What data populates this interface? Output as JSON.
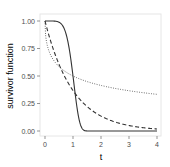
{
  "chart_data": {
    "type": "line",
    "title": "",
    "xlabel": "t",
    "ylabel": "survivor function",
    "xlim": [
      0,
      4
    ],
    "ylim": [
      0,
      1
    ],
    "x_ticks": [
      "0",
      "1",
      "2",
      "3",
      "4"
    ],
    "y_ticks": [
      "0.00",
      "0.25",
      "0.50",
      "0.75",
      "1.00"
    ],
    "grid": false,
    "legend": null,
    "x": [
      0,
      0.25,
      0.5,
      0.75,
      1,
      1.25,
      1.5,
      1.75,
      2,
      2.5,
      3,
      3.5,
      4
    ],
    "series": [
      {
        "name": "solid",
        "style": "solid",
        "values": [
          1.0,
          1.0,
          0.99,
          0.91,
          0.5,
          0.12,
          0.01,
          0.0,
          0.0,
          0.0,
          0.0,
          0.0,
          0.0
        ]
      },
      {
        "name": "dashed",
        "style": "dashed",
        "values": [
          1.0,
          0.78,
          0.61,
          0.47,
          0.37,
          0.29,
          0.22,
          0.17,
          0.14,
          0.08,
          0.05,
          0.03,
          0.02
        ]
      },
      {
        "name": "dotted",
        "style": "dotted",
        "values": [
          1.0,
          0.67,
          0.59,
          0.54,
          0.5,
          0.47,
          0.45,
          0.43,
          0.41,
          0.39,
          0.37,
          0.35,
          0.33
        ]
      }
    ]
  },
  "colors": {
    "line": "#333333",
    "panel_border": "#e0e0e0",
    "tick_text": "#4d4d4d"
  }
}
